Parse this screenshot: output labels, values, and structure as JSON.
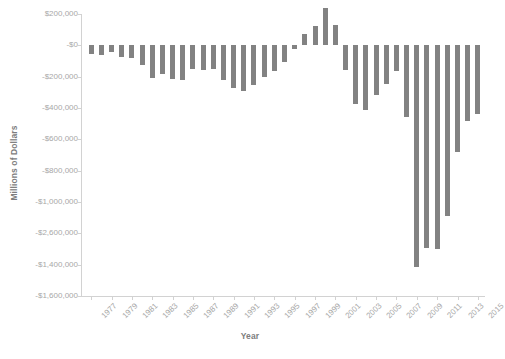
{
  "chart_data": {
    "type": "bar",
    "title": "",
    "xlabel": "Year",
    "ylabel": "Millions of Dollars",
    "grid": false,
    "legend": "none",
    "bar_color": "#828282",
    "ylim": [
      -1600000,
      200000
    ],
    "ytick_values": [
      200000,
      0,
      -200000,
      -400000,
      -600000,
      -800000,
      -1000000,
      -1200000,
      -1400000,
      -1600000
    ],
    "ytick_labels": [
      "$200,000",
      "-$0",
      "-$200,000",
      "-$400,000",
      "-$600,000",
      "-$800,000",
      "-$1,000,000",
      "-$2,600,000",
      "-$1,400,000",
      "-$1,600,000"
    ],
    "xtick_labels": [
      "1977",
      "1979",
      "1981",
      "1983",
      "1985",
      "1987",
      "1989",
      "1991",
      "1993",
      "1995",
      "1997",
      "1999",
      "2001",
      "2003",
      "2005",
      "2007",
      "2009",
      "2011",
      "2013",
      "2015"
    ],
    "categories": [
      "1977",
      "1978",
      "1979",
      "1980",
      "1981",
      "1982",
      "1983",
      "1984",
      "1985",
      "1986",
      "1987",
      "1988",
      "1989",
      "1990",
      "1991",
      "1992",
      "1993",
      "1994",
      "1995",
      "1996",
      "1997",
      "1998",
      "1999",
      "2000",
      "2001",
      "2002",
      "2003",
      "2004",
      "2005",
      "2006",
      "2007",
      "2008",
      "2009",
      "2010",
      "2011",
      "2012",
      "2013",
      "2014",
      "2015"
    ],
    "values": [
      -53659,
      -59186,
      -40726,
      -73835,
      -78976,
      -127977,
      -207802,
      -185429,
      -212308,
      -221227,
      -149730,
      -155178,
      -152639,
      -221036,
      -269238,
      -290321,
      -255051,
      -203186,
      -163952,
      -107431,
      -21884,
      69270,
      125610,
      236241,
      128236,
      -157758,
      -377585,
      -412727,
      -318346,
      -248181,
      -160701,
      -458553,
      -1412688,
      -1294373,
      -1299593,
      -1086958,
      -679500,
      -484600,
      -438900
    ]
  },
  "footer": {
    "note": ""
  }
}
